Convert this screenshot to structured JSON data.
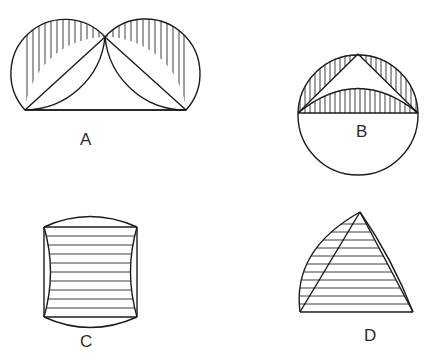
{
  "page": {
    "background_color": "#ffffff",
    "width": 444,
    "height": 362,
    "stroke_color": "#1c1c1c",
    "hatch_color": "#2a2a2a",
    "outline_width": 1.4,
    "hatch_width": 0.9
  },
  "figures": [
    {
      "id": "A",
      "label": "A",
      "description": "Two hatched lunes over a triangle inscribed in a large arc",
      "hatch_direction": "vertical",
      "geometry": {
        "base_left_x": 25,
        "base_right_x": 186,
        "base_y": 110,
        "apex_x": 105,
        "apex_y": 37,
        "big_arc_radius": 81,
        "lune_count": 2
      }
    },
    {
      "id": "B",
      "label": "B",
      "description": "Circle with diameter, inscribed apex triangle and hatched segments",
      "hatch_direction": "vertical",
      "geometry": {
        "center_x": 358,
        "center_y": 115,
        "radius": 60,
        "diameter_y": 113,
        "apex_x": 358,
        "apex_y": 54,
        "inner_arc_sag": 30
      }
    },
    {
      "id": "C",
      "label": "C",
      "description": "Square with convex top and bottom arcs and concave side arcs",
      "hatch_direction": "horizontal",
      "geometry": {
        "left_x": 44,
        "right_x": 137,
        "top_y": 227,
        "bottom_y": 317,
        "cap_bulge": 14,
        "side_inset": 13,
        "hatch_spacing": 9
      }
    },
    {
      "id": "D",
      "label": "D",
      "description": "Curved triangle with convex left arc and right sliver",
      "hatch_direction": "horizontal",
      "geometry": {
        "apex_x": 360,
        "apex_y": 212,
        "base_left_x": 300,
        "base_right_x": 413,
        "base_y": 312,
        "left_arc_bulge": 24,
        "right_arc_bulge": 18,
        "hatch_spacing": 8
      }
    }
  ]
}
